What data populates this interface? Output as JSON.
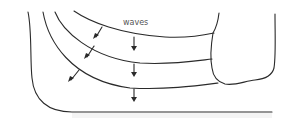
{
  "diagram": {
    "title_label": "waves",
    "colors": {
      "stroke": "#2a2a2a",
      "headland_fill": "#f0f0f0",
      "label": "#555555"
    },
    "elements": [
      "coastline",
      "wave-front-1",
      "wave-front-2",
      "wave-front-3",
      "headland"
    ]
  }
}
